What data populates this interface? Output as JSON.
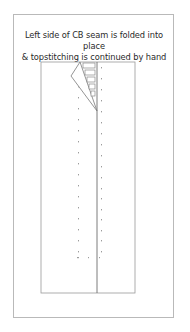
{
  "caption": {
    "line1": "Left side of CB seam is folded into place",
    "line2": "& topstitching is continued by hand"
  },
  "diagram": {
    "colors": {
      "frame": "#b9b9b9",
      "garment_outline": "#8a8a8a",
      "seam_line": "#6e6e6e",
      "stitch_dots": "#a0a0a0"
    },
    "parts": [
      "outer-frame",
      "garment-panel",
      "cb-seam-line",
      "folded-flap",
      "stitch-bars",
      "left-topstitch-row",
      "right-topstitch-row"
    ]
  }
}
